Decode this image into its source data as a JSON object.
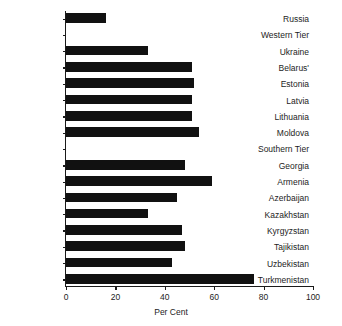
{
  "chart_data": {
    "type": "bar",
    "orientation": "horizontal",
    "title": "",
    "xlabel": "Per Cent",
    "ylabel": "",
    "xlim": [
      0,
      100
    ],
    "xticks": [
      0,
      20,
      40,
      60,
      80,
      100
    ],
    "grid": false,
    "legend": null,
    "categories": [
      "Russia",
      "Western Tier",
      "Ukraine",
      "Belarus'",
      "Estonia",
      "Latvia",
      "Lithuania",
      "Moldova",
      "Southern Tier",
      "Georgia",
      "Armenia",
      "Azerbaijan",
      "Kazakhstan",
      "Kyrgyzstan",
      "Tajikistan",
      "Uzbekistan",
      "Turkmenistan"
    ],
    "values": [
      16,
      null,
      33,
      51,
      52,
      51,
      51,
      54,
      null,
      48,
      59,
      45,
      33,
      47,
      48,
      43,
      76
    ],
    "group_headers": [
      "Western Tier",
      "Southern Tier"
    ],
    "bar_color": "#111111"
  },
  "axis": {
    "x_title": "Per Cent",
    "tick_labels": [
      "0",
      "20",
      "40",
      "60",
      "80",
      "100"
    ]
  }
}
